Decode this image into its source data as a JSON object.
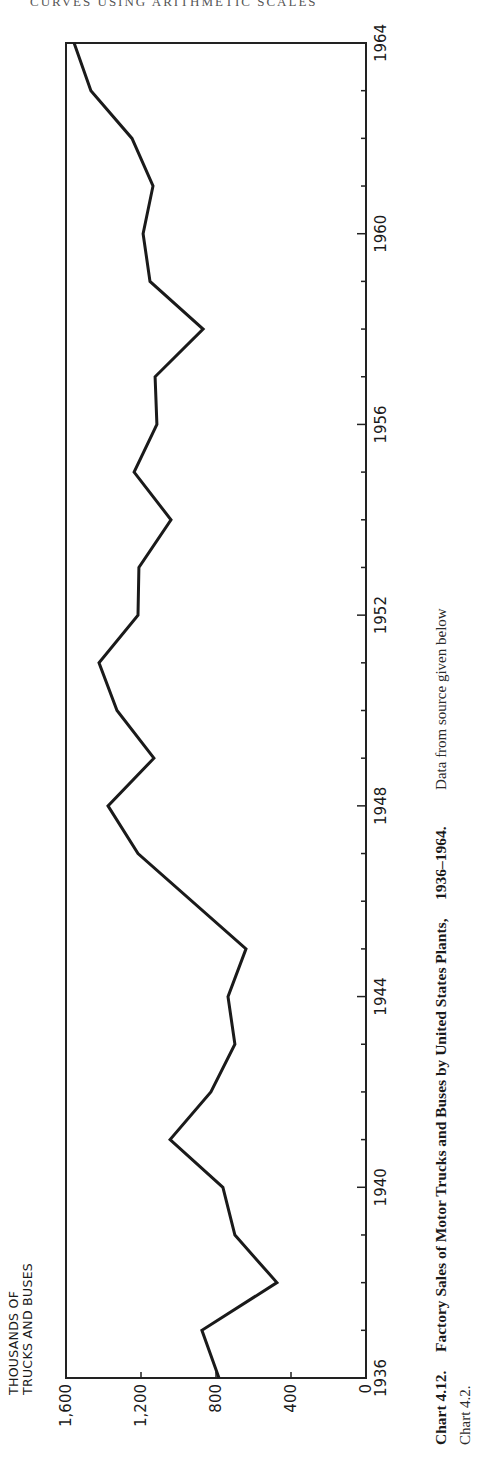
{
  "page": {
    "running_header": "CURVES USING ARITHMETIC SCALES"
  },
  "chart": {
    "y_axis_title_line1": "THOUSANDS OF",
    "y_axis_title_line2": "TRUCKS AND BUSES",
    "y_tick_labels": [
      "1,600",
      "1,200",
      "800",
      "400",
      "0"
    ],
    "x_tick_labels": [
      "1936",
      "1940",
      "1944",
      "1948",
      "1952",
      "1956",
      "1960",
      "1964"
    ]
  },
  "caption": {
    "number": "Chart 4.12.",
    "title": "Factory Sales of Motor Trucks and Buses by United States Plants,",
    "years": "1936–1964.",
    "source_line1": "Data from source given below",
    "source_line2": "Chart 4.2."
  },
  "chart_data": {
    "type": "line",
    "title": "Factory Sales of Motor Trucks and Buses by United States Plants, 1936–1964",
    "xlabel": "",
    "ylabel": "Thousands of trucks and buses",
    "orientation_note": "figure printed rotated 90° counter-clockwise on the page",
    "x": [
      1936,
      1937,
      1938,
      1939,
      1940,
      1941,
      1942,
      1943,
      1944,
      1945,
      1946,
      1947,
      1948,
      1949,
      1950,
      1951,
      1952,
      1953,
      1954,
      1955,
      1956,
      1957,
      1958,
      1959,
      1960,
      1961,
      1962,
      1963,
      1964
    ],
    "series": [
      {
        "name": "Factory sales (thousands)",
        "values": [
          784,
          875,
          475,
          699,
          763,
          1045,
          827,
          699,
          736,
          640,
          null,
          1216,
          1376,
          1131,
          1328,
          1424,
          1216,
          1211,
          1040,
          1237,
          1115,
          1125,
          869,
          1152,
          1189,
          1136,
          1248,
          1467,
          1557
        ]
      }
    ],
    "xlim": [
      1936,
      1964
    ],
    "ylim": [
      0,
      1600
    ],
    "x_ticks": [
      1936,
      1940,
      1944,
      1948,
      1952,
      1956,
      1960,
      1964
    ],
    "y_ticks": [
      0,
      400,
      800,
      1200,
      1600
    ],
    "grid": false,
    "legend": null,
    "caption": "Chart 4.12. Factory Sales of Motor Trucks and Buses by United States Plants, 1936–1964. Data from source given below Chart 4.2."
  }
}
